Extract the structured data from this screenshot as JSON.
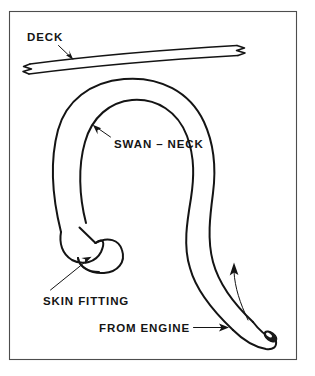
{
  "figure": {
    "background_color": "#ffffff",
    "ink_color": "#141414",
    "border_color": "#4d4d4d"
  },
  "labels": {
    "deck": "DECK",
    "swan_neck": "SWAN – NECK",
    "skin_fitting": "SKIN FITTING",
    "from_engine": "FROM ENGINE"
  },
  "parts": {
    "deck_plank": {
      "name": "deck",
      "break_marks": 2,
      "description": "horizontal deck plank drawn in section with zigzag break symbols at both ends"
    },
    "swan_neck_pipe": {
      "name": "swan-neck",
      "description": "large inverted-U pipe loop rising above the deck level"
    },
    "skin_fitting": {
      "name": "skin fitting",
      "description": "bell shaped outlet fitting at the lower end of the left pipe leg"
    },
    "engine_inlet": {
      "name": "from engine",
      "description": "lower right pipe leg with open bore, gas flows upward"
    }
  },
  "annotations": {
    "flow_direction": "upward from engine through the swan-neck",
    "leaders": [
      {
        "label": "DECK",
        "points_to": "deck_plank"
      },
      {
        "label": "SWAN – NECK",
        "points_to": "swan_neck_pipe"
      },
      {
        "label": "SKIN FITTING",
        "points_to": "skin_fitting"
      },
      {
        "label": "FROM ENGINE",
        "points_to": "engine_inlet"
      }
    ]
  }
}
